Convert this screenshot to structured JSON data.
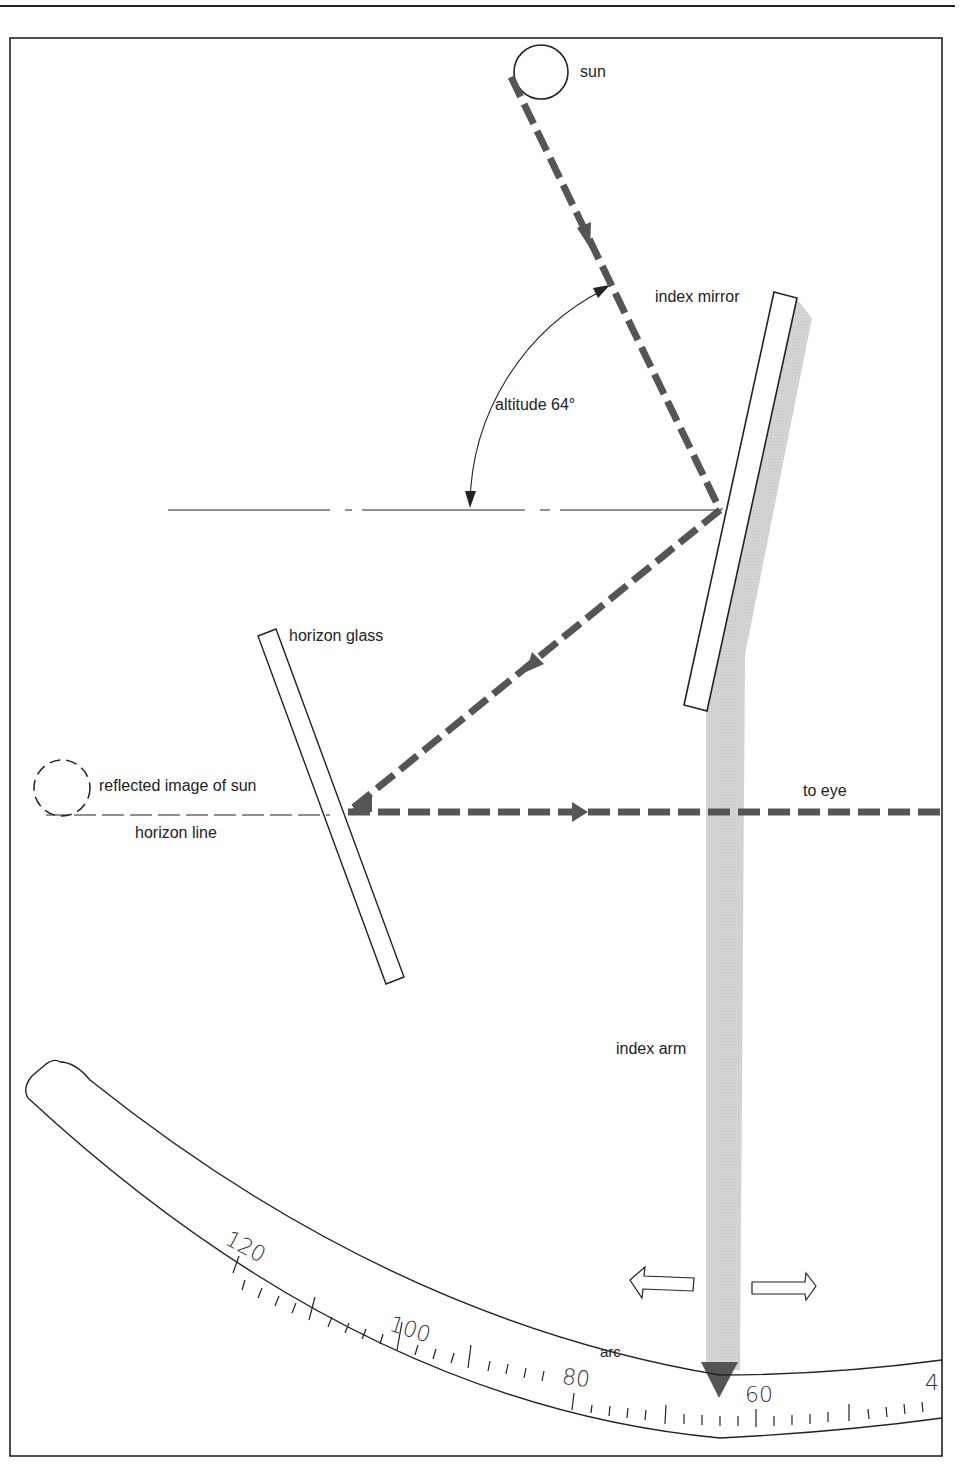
{
  "diagram": {
    "labels": {
      "sun": "sun",
      "index_mirror": "index mirror",
      "altitude": "altitude 64°",
      "horizon_glass": "horizon glass",
      "reflected_image": "reflected image of sun",
      "horizon_line": "horizon line",
      "to_eye": "to eye",
      "index_arm": "index arm",
      "arc": "arc"
    },
    "scale_ticks": [
      "120",
      "100",
      "80",
      "60",
      "4"
    ],
    "altitude_deg": 64,
    "colors": {
      "ray": "#555555",
      "index_arm": "#cfcfcf",
      "line": "#222222",
      "pointer": "#555555"
    }
  }
}
